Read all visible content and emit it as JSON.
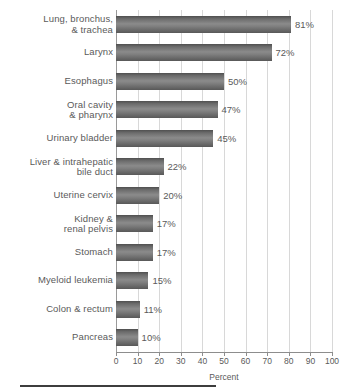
{
  "chart_data": {
    "type": "bar",
    "orientation": "horizontal",
    "title": "",
    "subtitle": "",
    "xlabel": "Percent",
    "ylabel": "",
    "xlim": [
      0,
      100
    ],
    "xticks": [
      0,
      10,
      20,
      30,
      40,
      50,
      60,
      70,
      80,
      90,
      100
    ],
    "xtick_labels": [
      "0",
      "10",
      "20",
      "30",
      "40",
      "50",
      "60",
      "70",
      "80",
      "90",
      "100"
    ],
    "grid": "vertical",
    "legend": "none",
    "value_label_suffix": "%",
    "bar_color": "#6e6e6e",
    "gridline_color": "#d8d8d8",
    "axis_color": "#8d8d8d",
    "text_color": "#5a5a5a",
    "background_color": "#ffffff",
    "categories": [
      "Lung, bronchus, & trachea",
      "Larynx",
      "Esophagus",
      "Oral cavity & pharynx",
      "Urinary bladder",
      "Liver & intrahepatic bile duct",
      "Uterine cervix",
      "Kidney & renal pelvis",
      "Stomach",
      "Myeloid leukemia",
      "Colon & rectum",
      "Pancreas"
    ],
    "values": [
      81,
      72,
      50,
      47,
      45,
      22,
      20,
      17,
      17,
      15,
      11,
      10
    ],
    "bars": [
      {
        "label_line1": "Lung, bronchus,",
        "label_line2": "& trachea",
        "value": 81,
        "value_label": "81%"
      },
      {
        "label_line1": "Larynx",
        "label_line2": "",
        "value": 72,
        "value_label": "72%"
      },
      {
        "label_line1": "Esophagus",
        "label_line2": "",
        "value": 50,
        "value_label": "50%"
      },
      {
        "label_line1": "Oral cavity",
        "label_line2": "& pharynx",
        "value": 47,
        "value_label": "47%"
      },
      {
        "label_line1": "Urinary bladder",
        "label_line2": "",
        "value": 45,
        "value_label": "45%"
      },
      {
        "label_line1": "Liver & intrahepatic",
        "label_line2": "bile duct",
        "value": 22,
        "value_label": "22%"
      },
      {
        "label_line1": "Uterine cervix",
        "label_line2": "",
        "value": 20,
        "value_label": "20%"
      },
      {
        "label_line1": "Kidney &",
        "label_line2": "renal pelvis",
        "value": 17,
        "value_label": "17%"
      },
      {
        "label_line1": "Stomach",
        "label_line2": "",
        "value": 17,
        "value_label": "17%"
      },
      {
        "label_line1": "Myeloid leukemia",
        "label_line2": "",
        "value": 15,
        "value_label": "15%"
      },
      {
        "label_line1": "Colon & rectum",
        "label_line2": "",
        "value": 11,
        "value_label": "11%"
      },
      {
        "label_line1": "Pancreas",
        "label_line2": "",
        "value": 10,
        "value_label": "10%"
      }
    ]
  }
}
